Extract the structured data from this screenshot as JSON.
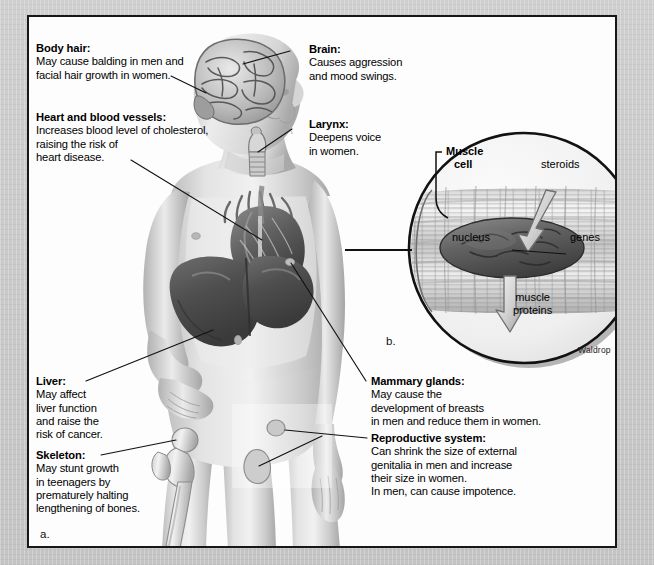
{
  "figure": {
    "panel_label_a": "a.",
    "panel_label_b": "b.",
    "credit": "Waldrop",
    "background_color": "#c9c9c9",
    "panel_color": "#fdfdfd",
    "border_color": "#15171a"
  },
  "body_labels": [
    {
      "id": "body-hair",
      "heading": "Body hair:",
      "lines": [
        "May cause balding in men and",
        "facial hair growth in women."
      ]
    },
    {
      "id": "heart-and-blood-vessels",
      "heading": "Heart and blood vessels:",
      "lines": [
        "Increases blood level of cholesterol,",
        "raising the risk of",
        "heart disease."
      ]
    },
    {
      "id": "brain",
      "heading": "Brain:",
      "lines": [
        "Causes aggression",
        "and mood swings."
      ]
    },
    {
      "id": "larynx",
      "heading": "Larynx:",
      "lines": [
        "Deepens voice",
        "in women."
      ]
    },
    {
      "id": "liver",
      "heading": "Liver:",
      "lines": [
        "May affect",
        "liver function",
        "and raise the",
        "risk of cancer."
      ]
    },
    {
      "id": "skeleton",
      "heading": "Skeleton:",
      "lines": [
        "May stunt growth",
        "in teenagers by",
        "prematurely halting",
        "lengthening of bones."
      ]
    },
    {
      "id": "mammary-glands",
      "heading": "Mammary glands:",
      "lines": [
        "May cause the",
        "development of breasts",
        "in men and reduce them in women."
      ]
    },
    {
      "id": "reproductive-system",
      "heading": "Reproductive system:",
      "lines": [
        "Can shrink the size of external",
        "genitalia in men and increase",
        "their size in women.",
        "In men, can cause impotence."
      ]
    }
  ],
  "inset": {
    "muscle_cell": "Muscle\ncell",
    "muscle_cell_l1": "Muscle",
    "muscle_cell_l2": "cell",
    "steroids": "steroids",
    "nucleus": "nucleus",
    "genes": "genes",
    "muscle_proteins_l1": "muscle",
    "muscle_proteins_l2": "proteins"
  }
}
